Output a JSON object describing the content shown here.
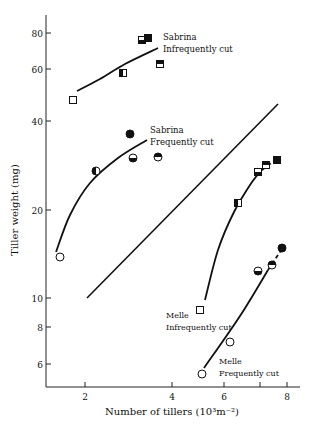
{
  "chart_data": {
    "type": "scatter",
    "title": "",
    "xlabel": "Number of tillers (10³m⁻²)",
    "ylabel": "Tiller weight (mg)",
    "x_scale": "log",
    "y_scale": "log",
    "xlim": [
      1.4,
      9
    ],
    "ylim": [
      5.2,
      95
    ],
    "x_ticks": [
      {
        "value": 2,
        "label": "2",
        "px": 85
      },
      {
        "value": 4,
        "label": "4",
        "px": 172
      },
      {
        "value": 6,
        "label": "6",
        "px": 224
      },
      {
        "value": 7,
        "label": "",
        "px": 260
      },
      {
        "value": 8,
        "label": "8",
        "px": 287
      }
    ],
    "y_ticks": [
      {
        "value": 80,
        "label": "80",
        "px": 33
      },
      {
        "value": 60,
        "label": "60",
        "px": 69
      },
      {
        "value": 40,
        "label": "40",
        "px": 121
      },
      {
        "value": 20,
        "label": "20",
        "px": 210
      },
      {
        "value": 10,
        "label": "10",
        "px": 298
      },
      {
        "value": 8,
        "label": "8",
        "px": 327
      },
      {
        "value": 6,
        "label": "6",
        "px": 364
      }
    ],
    "grid": false,
    "legend_position": "inline annotations",
    "series": [
      {
        "name": "Sabrina Infrequently cut",
        "label_lines": [
          "Sabrina",
          "Infrequently cut"
        ],
        "marker": "square",
        "points": [
          {
            "x": 1.75,
            "y": 48,
            "fill": "open",
            "px": [
              73,
              100
            ]
          },
          {
            "x": 2.8,
            "y": 58,
            "fill": "left-half",
            "px": [
              123,
              73
            ]
          },
          {
            "x": 3.2,
            "y": 75,
            "fill": "bottom-half",
            "px": [
              142,
              40
            ]
          },
          {
            "x": 3.3,
            "y": 76,
            "fill": "filled",
            "px": [
              148,
              38
            ]
          },
          {
            "x": 3.6,
            "y": 62,
            "fill": "top-half",
            "px": [
              160,
              64
            ]
          }
        ],
        "curve_px": [
          [
            77,
            91
          ],
          [
            100,
            79
          ],
          [
            125,
            64
          ],
          [
            158,
            48
          ]
        ]
      },
      {
        "name": "Sabrina Frequently cut",
        "label_lines": [
          "Sabrina",
          "Frequently cut"
        ],
        "marker": "circle",
        "points": [
          {
            "x": 1.5,
            "y": 14,
            "fill": "open",
            "px": [
              60,
              257
            ]
          },
          {
            "x": 2.2,
            "y": 28,
            "fill": "left-half",
            "px": [
              96,
              171
            ]
          },
          {
            "x": 3.0,
            "y": 36,
            "fill": "filled",
            "px": [
              130,
              134
            ]
          },
          {
            "x": 3.05,
            "y": 30,
            "fill": "bottom-half",
            "px": [
              133,
              158
            ]
          },
          {
            "x": 3.6,
            "y": 31,
            "fill": "top-half",
            "px": [
              158,
              157
            ]
          }
        ],
        "curve_px": [
          [
            56,
            252
          ],
          [
            70,
            215
          ],
          [
            90,
            183
          ],
          [
            118,
            158
          ],
          [
            147,
            140
          ]
        ]
      },
      {
        "name": "Melle Infrequently cut",
        "label_lines": [
          "Melle",
          "Infrequently cut"
        ],
        "marker": "square",
        "points": [
          {
            "x": 5.1,
            "y": 9.2,
            "fill": "open",
            "px": [
              200,
              310
            ]
          },
          {
            "x": 6.4,
            "y": 21,
            "fill": "left-half",
            "px": [
              238,
              203
            ]
          },
          {
            "x": 7.1,
            "y": 27,
            "fill": "bottom-half",
            "px": [
              258,
              172
            ]
          },
          {
            "x": 7.4,
            "y": 28.5,
            "fill": "top-half",
            "px": [
              266,
              165
            ]
          },
          {
            "x": 7.7,
            "y": 29.5,
            "fill": "filled",
            "px": [
              277,
              160
            ]
          }
        ],
        "curve_px": [
          [
            205,
            300
          ],
          [
            218,
            250
          ],
          [
            234,
            212
          ],
          [
            252,
            182
          ],
          [
            262,
            170
          ]
        ],
        "dashed_px": [
          [
            262,
            170
          ],
          [
            278,
            158
          ]
        ]
      },
      {
        "name": "Melle Frequently cut",
        "label_lines": [
          "Melle",
          "Frequently cut"
        ],
        "marker": "circle",
        "points": [
          {
            "x": 5.1,
            "y": 5.5,
            "fill": "open",
            "px": [
              202,
              374
            ]
          },
          {
            "x": 6.2,
            "y": 6.9,
            "fill": "open",
            "px": [
              230,
              342
            ]
          },
          {
            "x": 7.1,
            "y": 12,
            "fill": "bottom-half",
            "px": [
              258,
              271
            ]
          },
          {
            "x": 7.6,
            "y": 12.5,
            "fill": "top-half",
            "px": [
              272,
              265
            ]
          },
          {
            "x": 7.9,
            "y": 14.5,
            "fill": "filled",
            "px": [
              282,
              248
            ]
          }
        ],
        "curve_px": [
          [
            204,
            368
          ],
          [
            240,
            316
          ],
          [
            268,
            270
          ]
        ],
        "dashed_px": [
          [
            268,
            270
          ],
          [
            284,
            246
          ]
        ]
      }
    ],
    "reference_line": {
      "description": "straight diagonal line",
      "px": [
        [
          87,
          298
        ],
        [
          278,
          104
        ]
      ]
    }
  },
  "labels": {
    "xlabel": "Number of tillers (10³m⁻²)",
    "ylabel": "Tiller weight (mg)",
    "sab_inf_1": "Sabrina",
    "sab_inf_2": "Infrequently cut",
    "sab_freq_1": "Sabrina",
    "sab_freq_2": "Frequently cut",
    "mel_inf_1": "Melle",
    "mel_inf_2": "Infrequently cut",
    "mel_freq_1": "Melle",
    "mel_freq_2": "Frequently cut"
  }
}
